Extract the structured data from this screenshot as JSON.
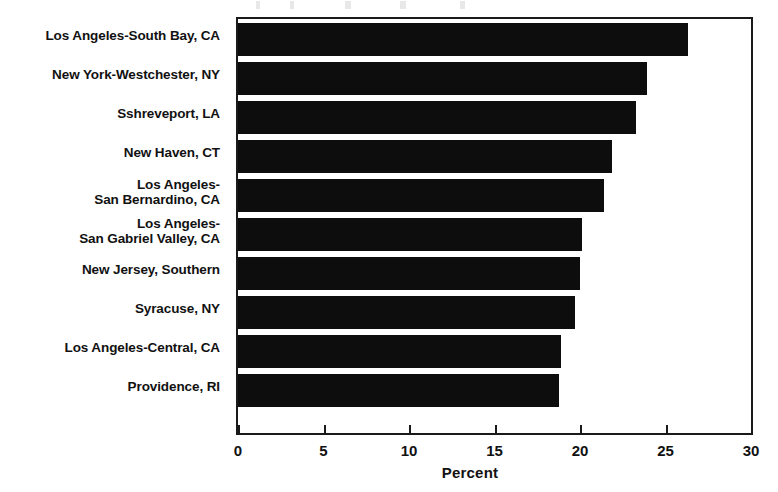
{
  "chart_data": {
    "type": "bar",
    "orientation": "horizontal",
    "title": "",
    "xlabel": "Percent",
    "ylabel": "",
    "xlim": [
      0,
      30
    ],
    "xticks": [
      0,
      5,
      10,
      15,
      20,
      25,
      30
    ],
    "xticklabels": [
      "0",
      "5",
      "10",
      "15",
      "20",
      "25",
      "30"
    ],
    "grid": false,
    "legend": null,
    "categories": [
      "Los Angeles-South Bay, CA",
      "New York-Westchester, NY",
      "Sshreveport, LA",
      "New Haven, CT",
      "Los Angeles-\nSan Bernardino, CA",
      "Los Angeles-\nSan Gabriel Valley, CA",
      "New Jersey, Southern",
      "Syracuse, NY",
      "Los Angeles-Central, CA",
      "Providence, RI"
    ],
    "values": [
      26.3,
      23.9,
      23.3,
      21.9,
      21.4,
      20.1,
      20.0,
      19.7,
      18.9,
      18.8
    ],
    "bar_color": "#0d0d0d",
    "axis_color": "#1a1a1a",
    "background_color": "#ffffff"
  }
}
